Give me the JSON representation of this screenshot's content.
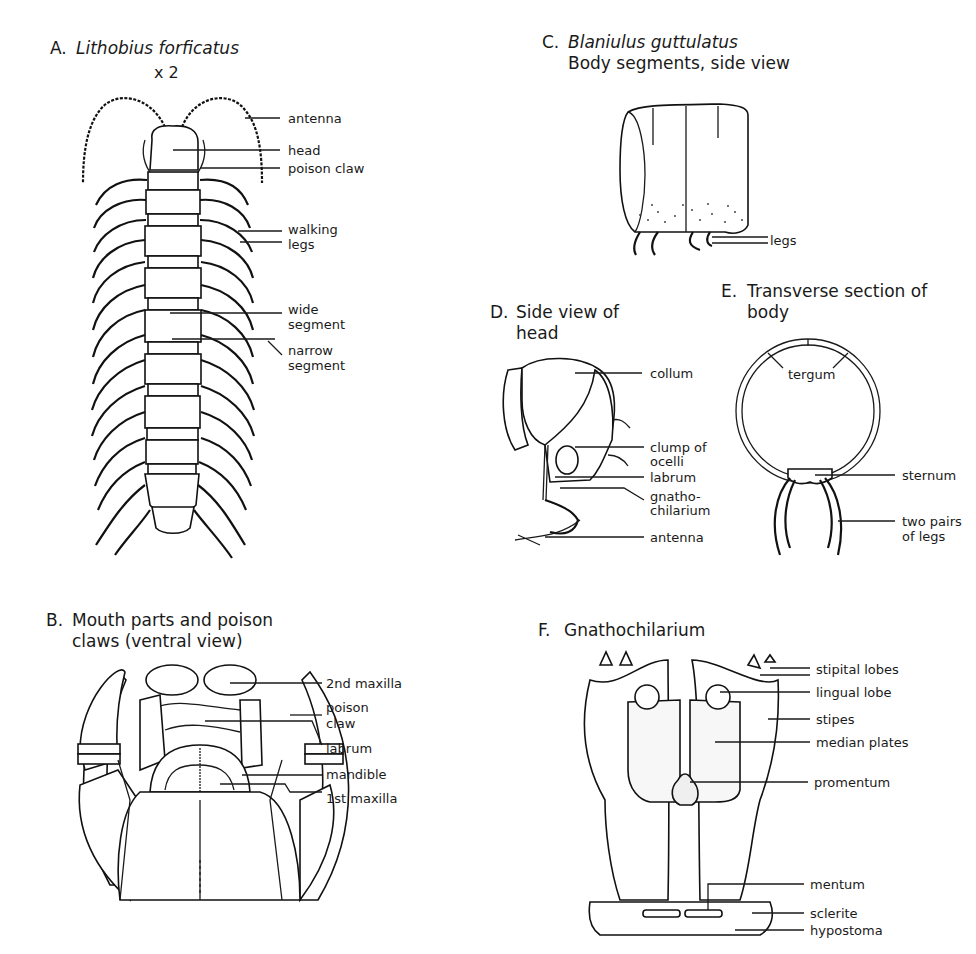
{
  "figure": {
    "panels": [
      {
        "id": "A",
        "letter": "A.",
        "title": "Lithobius forficatus",
        "title_italic": true,
        "scale": "x 2",
        "labels": [
          "antenna",
          "head",
          "poison claw",
          "walking",
          "legs",
          "wide",
          "segment",
          "narrow",
          "segment"
        ]
      },
      {
        "id": "B",
        "letter": "B.",
        "title_line1": "Mouth parts and poison",
        "title_line2": "claws (ventral view)",
        "labels": [
          "2nd maxilla",
          "poison",
          "claw",
          "labrum",
          "mandible",
          "1st maxilla"
        ]
      },
      {
        "id": "C",
        "letter": "C.",
        "title": "Blaniulus guttulatus",
        "title_italic": true,
        "subtitle": "Body segments, side view",
        "labels": [
          "legs"
        ]
      },
      {
        "id": "D",
        "letter": "D.",
        "title_line1": "Side view of",
        "title_line2": "head",
        "labels": [
          "collum",
          "clump of",
          "ocelli",
          "labrum",
          "gnatho-",
          "chilarium",
          "antenna"
        ]
      },
      {
        "id": "E",
        "letter": "E.",
        "title_line1": "Transverse section of",
        "title_line2": "body",
        "labels": [
          "tergum",
          "sternum",
          "two pairs",
          "of legs"
        ]
      },
      {
        "id": "F",
        "letter": "F.",
        "title": "Gnathochilarium",
        "labels": [
          "stipital lobes",
          "lingual lobe",
          "stipes",
          "median plates",
          "promentum",
          "mentum",
          "sclerite",
          "hypostoma"
        ]
      }
    ]
  }
}
